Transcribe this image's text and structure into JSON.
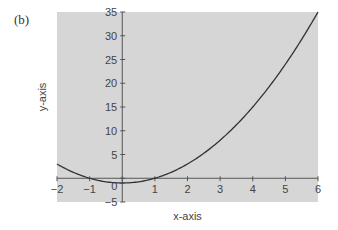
{
  "panel_label": "(b)",
  "chart_data": {
    "type": "line",
    "title": "",
    "xlabel": "x-axis",
    "ylabel": "y-axis",
    "xlim": [
      -2,
      6
    ],
    "ylim": [
      -5,
      35
    ],
    "x_ticks": [
      -2,
      -1,
      0,
      1,
      2,
      3,
      4,
      5,
      6
    ],
    "y_ticks": [
      -5,
      0,
      5,
      10,
      15,
      20,
      25,
      30,
      35
    ],
    "grid": false,
    "legend": null,
    "background": "#d6d6d6",
    "line_color": "#333333",
    "series": [
      {
        "name": "y = x^2 - 1",
        "x": [
          -2,
          -1.5,
          -1,
          -0.5,
          0,
          0.5,
          1,
          1.5,
          2,
          2.5,
          3,
          3.5,
          4,
          4.5,
          5,
          5.5,
          6
        ],
        "y": [
          3,
          1.25,
          0,
          -0.75,
          -1,
          -0.75,
          0,
          1.25,
          3,
          5.25,
          8,
          11.25,
          15,
          19.25,
          24,
          29.25,
          35
        ]
      }
    ]
  }
}
